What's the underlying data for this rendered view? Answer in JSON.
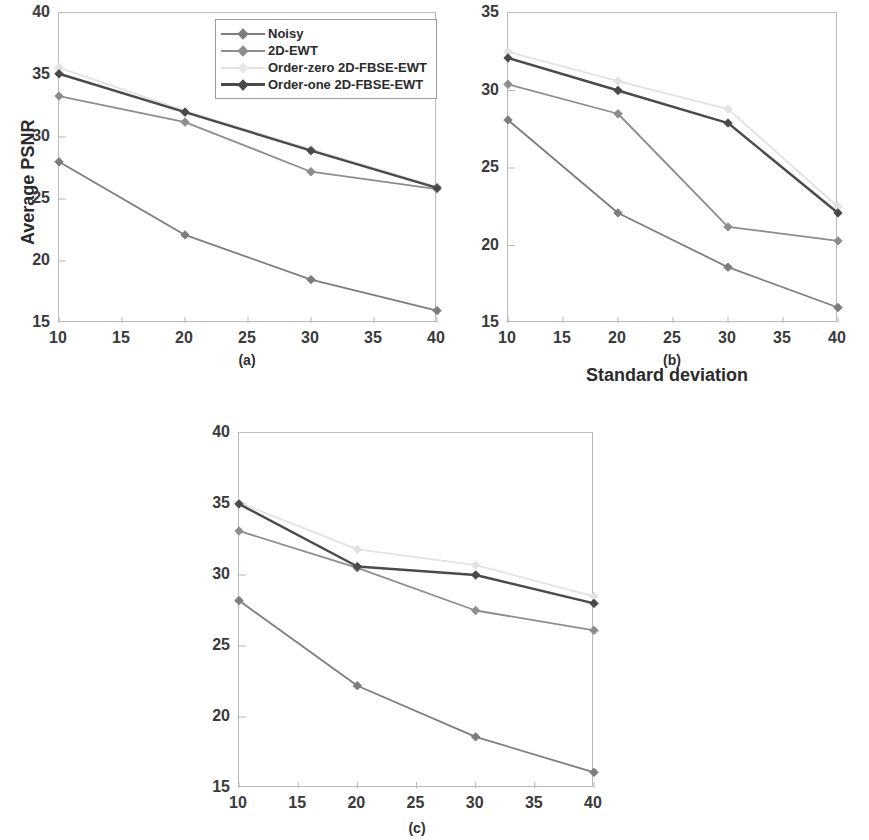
{
  "figure": {
    "y_axis_title": "Average PSNR",
    "x_axis_title": "Standard deviation"
  },
  "legend": {
    "position": "top-center-of-panel-a",
    "items": [
      {
        "label": "Noisy",
        "color": "#7d7d7d"
      },
      {
        "label": "2D-EWT",
        "color": "#8d8d8d"
      },
      {
        "label": "Order-zero 2D-FBSE-EWT",
        "color": "#e2e2e2"
      },
      {
        "label": "Order-one 2D-FBSE-EWT",
        "color": "#4a4a4a"
      }
    ]
  },
  "panels": [
    {
      "id": "a",
      "caption": "(a)"
    },
    {
      "id": "b",
      "caption": "(b)"
    },
    {
      "id": "c",
      "caption": "(c)"
    }
  ],
  "chart_data": [
    {
      "type": "line",
      "panel": "(a)",
      "title": "",
      "xlabel": "Standard deviation",
      "ylabel": "Average PSNR",
      "x": [
        10,
        20,
        30,
        40
      ],
      "xlim": [
        10,
        40
      ],
      "ylim": [
        15,
        40
      ],
      "xticks": [
        10,
        15,
        20,
        25,
        30,
        35,
        40
      ],
      "yticks": [
        15,
        20,
        25,
        30,
        35,
        40
      ],
      "grid": false,
      "series": [
        {
          "name": "Noisy",
          "color": "#7d7d7d",
          "values": [
            28.0,
            22.1,
            18.5,
            16.0
          ]
        },
        {
          "name": "2D-EWT",
          "color": "#8d8d8d",
          "values": [
            33.3,
            31.2,
            27.2,
            25.8
          ]
        },
        {
          "name": "Order-zero 2D-FBSE-EWT",
          "color": "#e2e2e2",
          "values": [
            35.6,
            32.1,
            29.0,
            26.0
          ]
        },
        {
          "name": "Order-one 2D-FBSE-EWT",
          "color": "#4a4a4a",
          "values": [
            35.1,
            32.0,
            28.9,
            25.9
          ]
        }
      ]
    },
    {
      "type": "line",
      "panel": "(b)",
      "title": "",
      "xlabel": "Standard deviation",
      "ylabel": "Average PSNR",
      "x": [
        10,
        20,
        30,
        40
      ],
      "xlim": [
        10,
        40
      ],
      "ylim": [
        15,
        35
      ],
      "xticks": [
        10,
        15,
        20,
        25,
        30,
        35,
        40
      ],
      "yticks": [
        15,
        20,
        25,
        30,
        35
      ],
      "grid": false,
      "series": [
        {
          "name": "Noisy",
          "color": "#7d7d7d",
          "values": [
            28.1,
            22.1,
            18.6,
            16.0
          ]
        },
        {
          "name": "2D-EWT",
          "color": "#8d8d8d",
          "values": [
            30.4,
            28.5,
            21.2,
            20.3
          ]
        },
        {
          "name": "Order-zero 2D-FBSE-EWT",
          "color": "#e2e2e2",
          "values": [
            32.5,
            30.6,
            28.8,
            22.5
          ]
        },
        {
          "name": "Order-one 2D-FBSE-EWT",
          "color": "#4a4a4a",
          "values": [
            32.1,
            30.0,
            27.9,
            22.1
          ]
        }
      ]
    },
    {
      "type": "line",
      "panel": "(c)",
      "title": "",
      "xlabel": "Standard deviation",
      "ylabel": "Average PSNR",
      "x": [
        10,
        20,
        30,
        40
      ],
      "xlim": [
        10,
        40
      ],
      "ylim": [
        15,
        40
      ],
      "xticks": [
        10,
        15,
        20,
        25,
        30,
        35,
        40
      ],
      "yticks": [
        15,
        20,
        25,
        30,
        35,
        40
      ],
      "grid": false,
      "series": [
        {
          "name": "Noisy",
          "color": "#7d7d7d",
          "values": [
            28.2,
            22.2,
            18.6,
            16.1
          ]
        },
        {
          "name": "2D-EWT",
          "color": "#8d8d8d",
          "values": [
            33.1,
            30.5,
            27.5,
            26.1
          ]
        },
        {
          "name": "Order-zero 2D-FBSE-EWT",
          "color": "#e2e2e2",
          "values": [
            35.1,
            31.8,
            30.7,
            28.5
          ]
        },
        {
          "name": "Order-one 2D-FBSE-EWT",
          "color": "#4a4a4a",
          "values": [
            35.0,
            30.6,
            30.0,
            28.0
          ]
        }
      ]
    }
  ]
}
